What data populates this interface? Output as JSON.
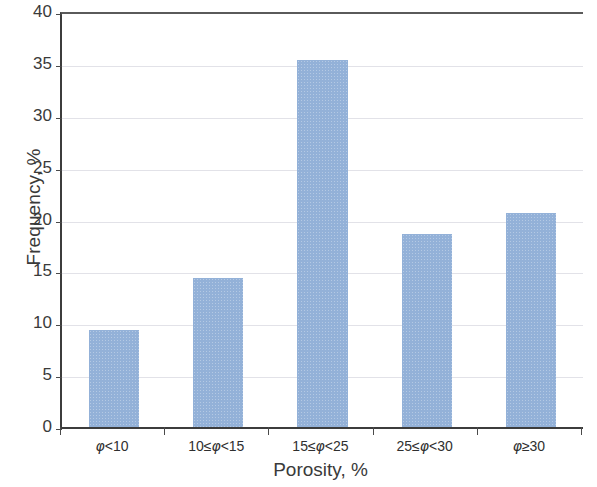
{
  "chart_data": {
    "type": "bar",
    "title": "",
    "subtitle": "",
    "xlabel": "Porosity, %",
    "ylabel": "Frequency, %",
    "categories": [
      "φ<10",
      "10≤φ<15",
      "15≤φ<25",
      "25≤φ<30",
      "φ≥30"
    ],
    "values": [
      9.5,
      14.6,
      35.6,
      18.8,
      20.8
    ],
    "ylim": [
      0,
      40
    ],
    "yticks": [
      0,
      5,
      10,
      15,
      20,
      25,
      30,
      35,
      40
    ],
    "ytick_labels": [
      "0",
      "5",
      "10",
      "15",
      "20",
      "25",
      "30",
      "35",
      "40"
    ],
    "grid": "horizontal",
    "legend": "none",
    "bar_color": "#93b1d8",
    "axis_color": "#3c3c3c",
    "gridline_color": "#e2e2e8"
  }
}
